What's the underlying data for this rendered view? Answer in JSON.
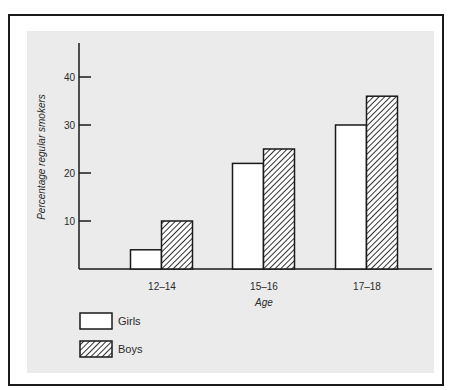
{
  "chart_data": {
    "type": "bar",
    "title": "",
    "xlabel": "Age",
    "ylabel": "Percentage regular smokers",
    "categories": [
      "12–14",
      "15–16",
      "17–18"
    ],
    "series": [
      {
        "name": "Girls",
        "pattern": "white",
        "values": [
          4,
          22,
          30
        ]
      },
      {
        "name": "Boys",
        "pattern": "diagonal-hatch",
        "values": [
          10,
          25,
          36
        ]
      }
    ],
    "yticks": [
      10,
      20,
      30,
      40
    ],
    "ylim": [
      0,
      45
    ],
    "grid": false,
    "legend_position": "bottom-left"
  },
  "colors": {
    "panel_background": "#ebebeb",
    "ink": "#1a1a1a",
    "girls_fill": "#ffffff"
  }
}
